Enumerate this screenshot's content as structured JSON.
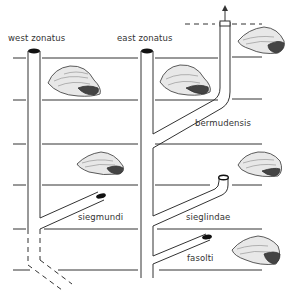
{
  "diagram": {
    "type": "phylogeny",
    "lineages": [
      {
        "id": "west-zonatus",
        "label": "west zonatus"
      },
      {
        "id": "east-zonatus",
        "label": "east zonatus"
      },
      {
        "id": "bermudensis",
        "label": "bermudensis"
      },
      {
        "id": "siegmundi",
        "label": "siegmundi"
      },
      {
        "id": "sieglindae",
        "label": "sieglindae"
      },
      {
        "id": "fasolti",
        "label": "fasolti"
      }
    ],
    "colors": {
      "line": "#333333",
      "background": "#ffffff",
      "tube_cap": "#111111"
    }
  }
}
